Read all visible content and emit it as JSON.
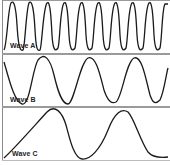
{
  "panels": [
    {
      "label": "Wave A",
      "cycles": 8
    },
    {
      "label": "Wave B",
      "cycles": 3
    },
    {
      "label": "Wave C",
      "cycles": 2
    }
  ],
  "colors": {
    "stroke": "#1a1a1a",
    "divider": "#9a9a9a",
    "background": "#ffffff"
  }
}
